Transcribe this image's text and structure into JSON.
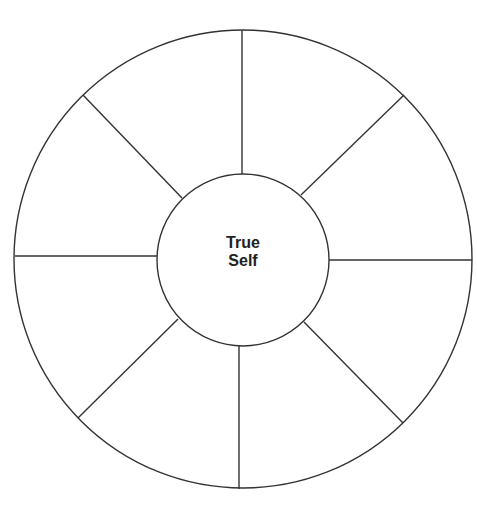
{
  "diagram": {
    "type": "wheel",
    "center_label": {
      "line1": "True",
      "line2": "Self"
    },
    "segments": 8,
    "colors": {
      "stroke": "#333333",
      "background": "#ffffff",
      "text": "#222222"
    },
    "outer_circle": {
      "cx": 243,
      "cy": 259,
      "r": 229
    },
    "inner_circle": {
      "cx": 243,
      "cy": 260,
      "r": 86
    },
    "spokes": [
      {
        "x1": 242,
        "y1": 30,
        "x2": 242,
        "y2": 174
      },
      {
        "x1": 404,
        "y1": 95,
        "x2": 301,
        "y2": 195
      },
      {
        "x1": 472,
        "y1": 260,
        "x2": 329,
        "y2": 260
      },
      {
        "x1": 403,
        "y1": 423,
        "x2": 304,
        "y2": 322
      },
      {
        "x1": 239,
        "y1": 489,
        "x2": 239,
        "y2": 346
      },
      {
        "x1": 78,
        "y1": 418,
        "x2": 178,
        "y2": 319
      },
      {
        "x1": 15,
        "y1": 256,
        "x2": 157,
        "y2": 256
      },
      {
        "x1": 83,
        "y1": 95,
        "x2": 182,
        "y2": 198
      }
    ]
  }
}
